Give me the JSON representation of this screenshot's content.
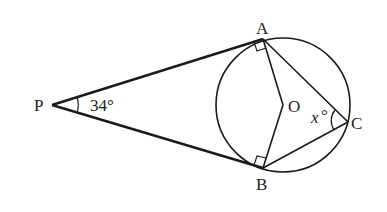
{
  "diagram": {
    "points": {
      "P": {
        "label": "P",
        "x": 52,
        "y": 105
      },
      "A": {
        "label": "A",
        "x": 263,
        "y": 39
      },
      "B": {
        "label": "B",
        "x": 263,
        "y": 168
      },
      "O": {
        "label": "O",
        "x": 283,
        "y": 105
      },
      "C": {
        "label": "C",
        "x": 348,
        "y": 122
      }
    },
    "circle": {
      "center": "O",
      "radius": 67
    },
    "angle_labels": {
      "P_angle": "34°",
      "C_angle_var": "x",
      "C_angle_deg": "°"
    },
    "right_angles": [
      "PAO",
      "PBO"
    ],
    "colors": {
      "stroke": "#1a1a1a",
      "background": "#ffffff"
    }
  }
}
